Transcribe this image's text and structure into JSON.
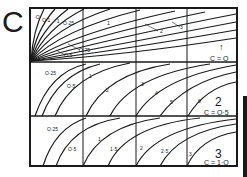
{
  "figure": {
    "panel_letter": "C",
    "ink_color": "#1a1a1a",
    "paper_color": "#ffffff"
  },
  "panels": [
    {
      "number": "1",
      "c_label": "C = O",
      "number_display": "↑",
      "curve_labels": [
        "·O",
        "O·1",
        "O·25",
        "·1",
        "O·5",
        "O·75",
        "1",
        "2",
        "3"
      ]
    },
    {
      "number": "2",
      "c_label": "C = O·5",
      "curve_labels": [
        "O·25",
        "O·5",
        "1",
        "2",
        "3",
        "4",
        "5",
        "6"
      ]
    },
    {
      "number": "3",
      "c_label": "C = 1·O",
      "curve_labels": [
        "O·25",
        "O·5",
        "1",
        "1·5",
        "2",
        "2·5",
        "3"
      ]
    }
  ]
}
